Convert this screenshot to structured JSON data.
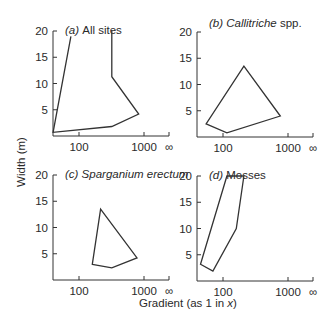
{
  "chart_data": [
    {
      "type": "line",
      "panel": "(a)",
      "title": "All sites",
      "title_italic": false,
      "xscale": "log",
      "xticks": [
        "100",
        "1000",
        "∞"
      ],
      "yticks": [
        "5",
        "10",
        "15",
        "20"
      ],
      "ylim": [
        0,
        20
      ],
      "shape": "open",
      "points": [
        [
          75,
          19
        ],
        [
          40,
          0.7
        ],
        [
          320,
          1.8
        ],
        [
          830,
          4.2
        ],
        [
          320,
          11.3
        ],
        [
          320,
          20
        ]
      ]
    },
    {
      "type": "line",
      "panel": "(b)",
      "title": "Callitriche",
      "title_suffix": "spp.",
      "title_italic": true,
      "xscale": "log",
      "xticks": [
        "100",
        "1000",
        "∞"
      ],
      "yticks": [
        "5",
        "10",
        "15",
        "20"
      ],
      "ylim": [
        0,
        20
      ],
      "shape": "closed",
      "points": [
        [
          55,
          2.5
        ],
        [
          115,
          0.8
        ],
        [
          760,
          4.0
        ],
        [
          210,
          13.5
        ]
      ]
    },
    {
      "type": "line",
      "panel": "(c)",
      "title": "Sparganium erectum",
      "title_suffix": "",
      "title_italic": true,
      "xscale": "log",
      "xticks": [
        "100",
        "1000",
        "∞"
      ],
      "yticks": [
        "5",
        "10",
        "15",
        "20"
      ],
      "ylim": [
        0,
        20
      ],
      "shape": "closed",
      "points": [
        [
          160,
          3.0
        ],
        [
          320,
          2.3
        ],
        [
          780,
          4.2
        ],
        [
          215,
          13.5
        ]
      ]
    },
    {
      "type": "line",
      "panel": "(d)",
      "title": "Mosses",
      "title_suffix": "",
      "title_italic": false,
      "xscale": "log",
      "xticks": [
        "100",
        "1000",
        "∞"
      ],
      "yticks": [
        "5",
        "10",
        "15",
        "20"
      ],
      "ylim": [
        0,
        20
      ],
      "shape": "closed",
      "points": [
        [
          45,
          3.2
        ],
        [
          70,
          1.9
        ],
        [
          160,
          10.0
        ],
        [
          210,
          20.0
        ],
        [
          115,
          20.0
        ]
      ]
    }
  ],
  "labels": {
    "ylabel": "Width  (m)",
    "xlabel_main": "Gradient  (as 1 in ",
    "xlabel_var": "x",
    "xlabel_end": ")"
  }
}
